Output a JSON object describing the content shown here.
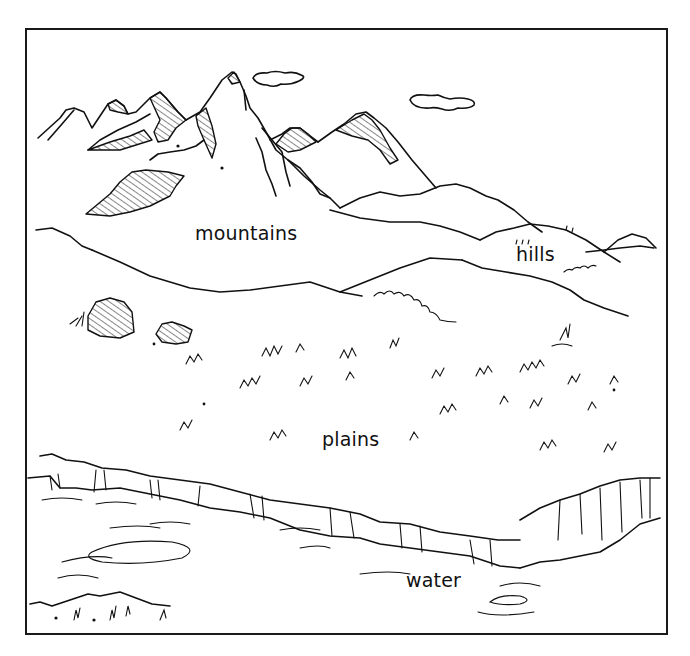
{
  "diagram": {
    "type": "landforms-illustration",
    "style": "black-and-white line drawing",
    "labels": {
      "mountains": "mountains",
      "hills": "hills",
      "plains": "plains",
      "water": "water"
    },
    "colors": {
      "ink": "#111111",
      "background": "#ffffff",
      "frame": "#1a1a1a"
    }
  }
}
